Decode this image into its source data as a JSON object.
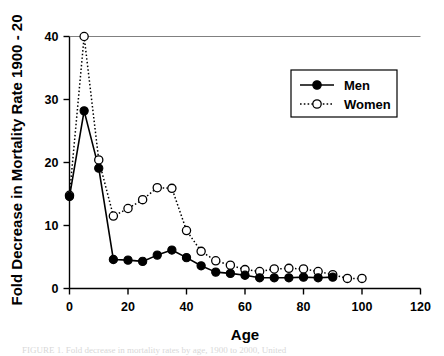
{
  "figure": {
    "caption_partial": "FIGURE 1. Fold decrease in mortality rates by age, 1900 to 2000, United"
  },
  "chart_data": {
    "type": "line",
    "title": "",
    "xlabel": "Age",
    "ylabel": "Fold Decrease in Mortality Rate 1900 - 20",
    "xlim": [
      0,
      120
    ],
    "ylim": [
      0,
      40
    ],
    "xticks": [
      0,
      20,
      40,
      60,
      80,
      100,
      120
    ],
    "xtick_labels": [
      "0",
      "20",
      "40",
      "60",
      "80",
      "100",
      "120"
    ],
    "yticks": [
      0,
      10,
      20,
      30,
      40
    ],
    "ytick_labels": [
      "0",
      "10",
      "20",
      "30",
      "40"
    ],
    "grid": false,
    "legend_position": "upper-right",
    "x": [
      0,
      5,
      10,
      15,
      20,
      25,
      30,
      35,
      40,
      45,
      50,
      55,
      60,
      65,
      70,
      75,
      80,
      85,
      90,
      95,
      100
    ],
    "series": [
      {
        "name": "Men",
        "marker": "filled-circle",
        "line_style": "solid",
        "color": "#000000",
        "values": [
          14.6,
          28.2,
          19.1,
          4.6,
          4.5,
          4.3,
          5.3,
          6.1,
          4.9,
          3.6,
          2.6,
          2.4,
          2.1,
          1.7,
          1.7,
          1.7,
          1.8,
          1.7,
          1.8,
          null,
          null
        ]
      },
      {
        "name": "Women",
        "marker": "open-circle",
        "line_style": "dotted",
        "color": "#000000",
        "values": [
          14.8,
          40.0,
          20.4,
          11.5,
          12.7,
          14.1,
          16.0,
          15.9,
          9.2,
          5.9,
          4.4,
          3.7,
          3.0,
          2.7,
          3.1,
          3.2,
          3.1,
          2.7,
          2.2,
          1.6,
          1.6
        ]
      }
    ]
  },
  "legend": {
    "entries": [
      {
        "label": "Men"
      },
      {
        "label": "Women"
      }
    ]
  }
}
